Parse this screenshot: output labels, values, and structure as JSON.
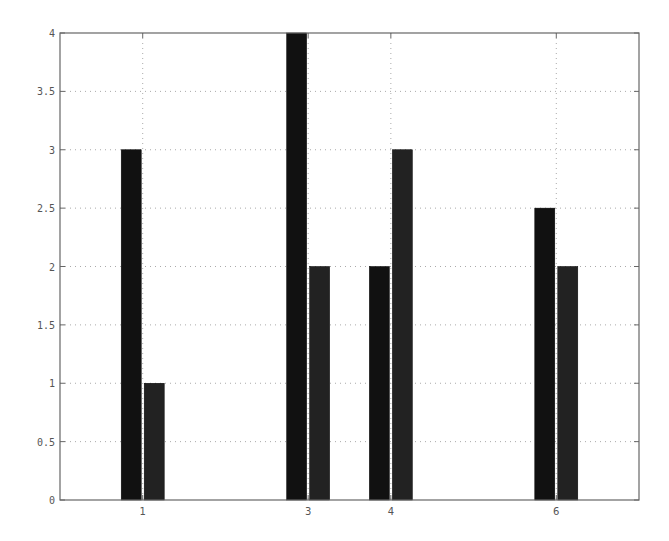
{
  "chart_data": {
    "type": "bar",
    "title": "",
    "xlabel": "",
    "ylabel": "",
    "x": [
      1,
      3,
      4,
      6
    ],
    "categories": [
      "1",
      "3",
      "4",
      "6"
    ],
    "series": [
      {
        "name": "series 1",
        "values": [
          3,
          4,
          2,
          2.5
        ],
        "color": "#111111"
      },
      {
        "name": "series 2",
        "values": [
          1,
          2,
          3,
          2
        ],
        "color": "#222222"
      }
    ],
    "xlim": [
      0,
      7
    ],
    "ylim": [
      0,
      4
    ],
    "yticks": [
      0,
      0.5,
      1,
      1.5,
      2,
      2.5,
      3,
      3.5,
      4
    ],
    "ytick_labels": [
      "0",
      "0.5",
      "1",
      "1.5",
      "2",
      "2.5",
      "3",
      "3.5",
      "4"
    ],
    "xticks": [
      1,
      3,
      4,
      6
    ],
    "xtick_labels": [
      "1",
      "3",
      "4",
      "6"
    ],
    "grid": true,
    "legend": null
  },
  "colors": {
    "axis": "#666666",
    "grid": "#aaaaaa",
    "background": "#ffffff"
  }
}
